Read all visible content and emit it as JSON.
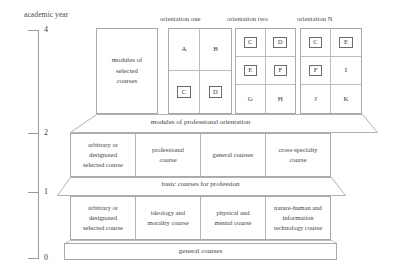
{
  "axis": {
    "title": "academic year",
    "ticks": [
      {
        "label": "4",
        "y": 30
      },
      {
        "label": "2",
        "y": 133
      },
      {
        "label": "1",
        "y": 192
      },
      {
        "label": "0",
        "y": 258
      }
    ]
  },
  "modules_selected": {
    "label": "modules of\nselected\ncourses"
  },
  "orientations": [
    {
      "heading": "orientation one",
      "columns": 2,
      "rows": 2,
      "cells": [
        {
          "letter": "A",
          "boxed": false
        },
        {
          "letter": "B",
          "boxed": false
        },
        {
          "letter": "C",
          "boxed": true
        },
        {
          "letter": "D",
          "boxed": true
        }
      ]
    },
    {
      "heading": "orientation two",
      "columns": 2,
      "rows": 3,
      "cells": [
        {
          "letter": "C",
          "boxed": true
        },
        {
          "letter": "D",
          "boxed": true
        },
        {
          "letter": "E",
          "boxed": true
        },
        {
          "letter": "F",
          "boxed": true
        },
        {
          "letter": "G",
          "boxed": false
        },
        {
          "letter": "H",
          "boxed": false
        }
      ]
    },
    {
      "heading": "orientation N",
      "columns": 2,
      "rows": 3,
      "cells": [
        {
          "letter": "C",
          "boxed": true
        },
        {
          "letter": "E",
          "boxed": true
        },
        {
          "letter": "F",
          "boxed": true
        },
        {
          "letter": "I",
          "boxed": false
        },
        {
          "letter": "J",
          "boxed": false
        },
        {
          "letter": "K",
          "boxed": false
        }
      ]
    }
  ],
  "bands": {
    "professional_orientation": "modules of professional orientation",
    "basic_courses": "basic courses for profession",
    "general_courses": "general courses"
  },
  "row_professional": [
    "arbitrary or\ndesignated\nselected course",
    "professional\ncourse",
    "general courses",
    "cross-specialty\ncourse"
  ],
  "row_basic": [
    "arbitrary or\ndesignated\nselected course",
    "ideology and\nmorality course",
    "physical and\nmental course",
    "nature-human and\ninformation\ntechnology course"
  ],
  "colors": {
    "line": "#a8a8a8",
    "inner_line": "#bdbdbd",
    "text": "#3a3a3a",
    "background": "#ffffff"
  }
}
